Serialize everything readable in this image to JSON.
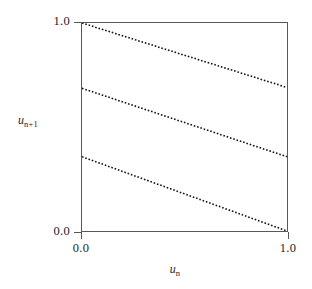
{
  "figure": {
    "background_color": "#ffffff",
    "frame_color": "#55595d",
    "line_color": "#111111"
  },
  "axes": {
    "x": {
      "label_base": "u",
      "label_sub": "n",
      "ticks": [
        {
          "value": 0.0,
          "text": "0.0"
        },
        {
          "value": 1.0,
          "text": "1.0"
        }
      ],
      "range": [
        0.0,
        1.0
      ]
    },
    "y": {
      "label_base": "u",
      "label_sub": "n+1",
      "ticks": [
        {
          "value": 0.0,
          "text": "0.0"
        },
        {
          "value": 1.0,
          "text": "1.0"
        }
      ],
      "range": [
        0.0,
        1.0
      ]
    }
  },
  "chart_data": {
    "type": "line",
    "title": "",
    "xlabel": "u_n",
    "ylabel": "u_{n+1}",
    "xlim": [
      0.0,
      1.0
    ],
    "ylim": [
      0.0,
      1.0
    ],
    "grid": false,
    "legend": "none",
    "linestyle": "dotted",
    "x": [
      0.0,
      1.0
    ],
    "series": [
      {
        "name": "branch-upper",
        "values": [
          1.0,
          0.69
        ],
        "intercept": 1.0,
        "slope": -0.31
      },
      {
        "name": "branch-middle",
        "values": [
          0.686,
          0.357
        ],
        "intercept": 0.686,
        "slope": -0.329
      },
      {
        "name": "branch-lower",
        "values": [
          0.357,
          0.0
        ],
        "intercept": 0.357,
        "slope": -0.357
      }
    ]
  }
}
